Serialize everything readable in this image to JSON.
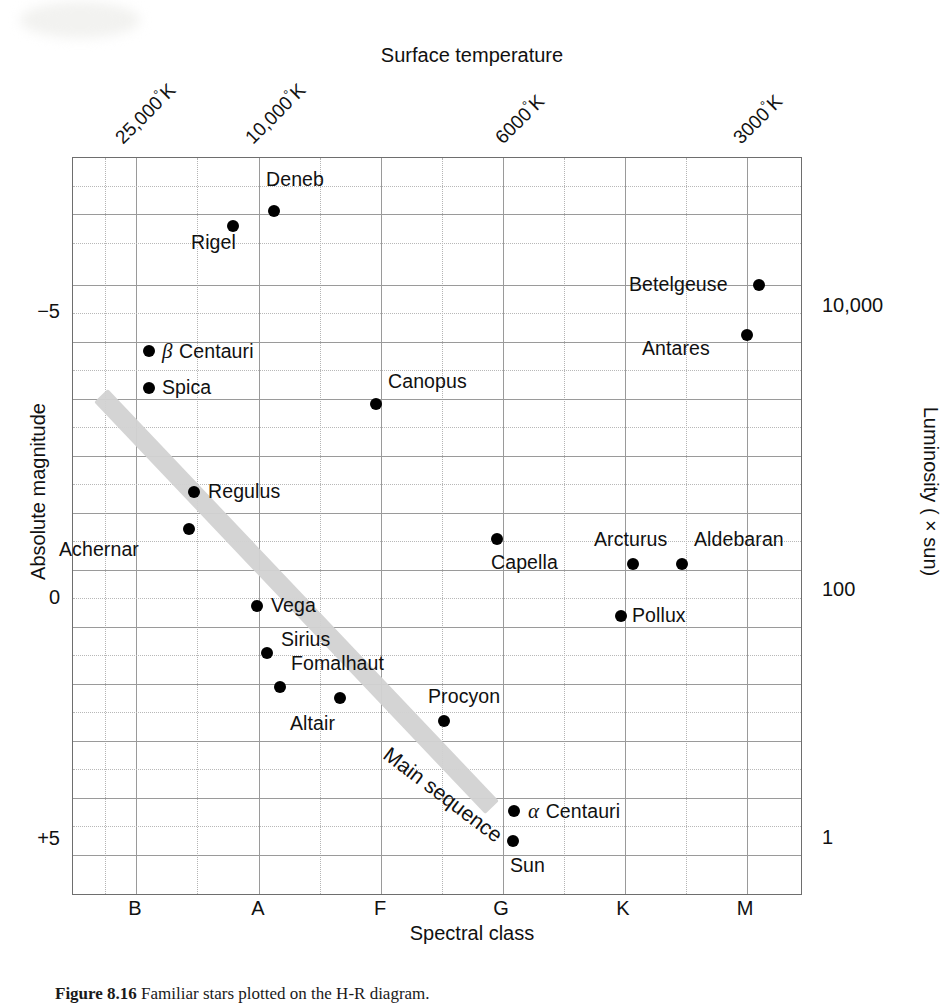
{
  "figure": {
    "caption_label": "Figure 8.16",
    "caption_text": "Familiar stars plotted on the H-R diagram."
  },
  "axes": {
    "top_title": "Surface temperature",
    "bottom_title": "Spectral class",
    "left_title": "Absolute magnitude",
    "right_title": "Luminosity ( × sun)",
    "top_ticks": [
      {
        "label": "25,000°K",
        "x": 25000
      },
      {
        "label": "10,000°K",
        "x": 10000
      },
      {
        "label": "6000°K",
        "x": 6000
      },
      {
        "label": "3000°K",
        "x": 3000
      }
    ],
    "spectral_classes": [
      "B",
      "A",
      "F",
      "G",
      "K",
      "M"
    ],
    "magnitude_ticks": [
      "−5",
      "0",
      "+5"
    ],
    "luminosity_ticks": [
      "10,000",
      "100",
      "1"
    ]
  },
  "annotations": {
    "main_sequence": "Main sequence"
  },
  "chart_data": {
    "type": "scatter",
    "title": "Familiar stars plotted on the H-R diagram",
    "xlabel": "Spectral class",
    "ylabel": "Absolute magnitude",
    "x2label": "Surface temperature",
    "y2label": "Luminosity ( × sun)",
    "grid": true,
    "legend": "none",
    "xticklabels": [
      "B",
      "A",
      "F",
      "G",
      "K",
      "M"
    ],
    "yticklabels": [
      "−5",
      "0",
      "+5"
    ],
    "ylim": [
      6.2,
      -8.2
    ],
    "y2ticklabels": [
      "10,000",
      "100",
      "1"
    ],
    "x2ticklabels": [
      "25,000°K",
      "10,000°K",
      "6000°K",
      "3000°K"
    ],
    "points": [
      {
        "name": "Deneb",
        "spectral": "A",
        "abs_mag": -7.2,
        "px": 273,
        "py": 210,
        "label_dx": -8,
        "label_dy": -31,
        "align": "left"
      },
      {
        "name": "Rigel",
        "spectral": "B",
        "abs_mag": -6.9,
        "px": 232,
        "py": 225,
        "label_dx": -42,
        "label_dy": 17,
        "align": "left"
      },
      {
        "name": "Betelgeuse",
        "spectral": "M",
        "abs_mag": -5.6,
        "px": 758,
        "py": 284,
        "label_dx": -130,
        "label_dy": 0,
        "align": "left"
      },
      {
        "name": "Antares",
        "spectral": "M",
        "abs_mag": -4.7,
        "px": 746,
        "py": 334,
        "label_dx": -105,
        "label_dy": 14,
        "align": "left"
      },
      {
        "name": "β Centauri",
        "spectral": "B",
        "abs_mag": -4.1,
        "px": 148,
        "py": 350,
        "label_dx": 13,
        "label_dy": 0,
        "align": "left",
        "greek": "β",
        "rest": "Centauri"
      },
      {
        "name": "Spica",
        "spectral": "B",
        "abs_mag": -3.5,
        "px": 148,
        "py": 387,
        "label_dx": 13,
        "label_dy": 0,
        "align": "left"
      },
      {
        "name": "Canopus",
        "spectral": "F",
        "abs_mag": -3.1,
        "px": 375,
        "py": 403,
        "label_dx": 12,
        "label_dy": -22,
        "align": "left"
      },
      {
        "name": "Regulus",
        "spectral": "B",
        "abs_mag": -0.6,
        "px": 193,
        "py": 491,
        "label_dx": 14,
        "label_dy": 0,
        "align": "left"
      },
      {
        "name": "Achernar",
        "spectral": "B",
        "abs_mag": -0.1,
        "px": 188,
        "py": 528,
        "label_dx": -130,
        "label_dy": 21,
        "align": "left"
      },
      {
        "name": "Capella",
        "spectral": "G",
        "abs_mag": 0.4,
        "px": 496,
        "py": 538,
        "label_dx": -6,
        "label_dy": 24,
        "align": "left"
      },
      {
        "name": "Arcturus",
        "spectral": "K",
        "abs_mag": 0.8,
        "px": 632,
        "py": 563,
        "label_dx": -39,
        "label_dy": -24,
        "align": "left"
      },
      {
        "name": "Aldebaran",
        "spectral": "K",
        "abs_mag": 0.8,
        "px": 681,
        "py": 563,
        "label_dx": 12,
        "label_dy": -24,
        "align": "left"
      },
      {
        "name": "Vega",
        "spectral": "A",
        "abs_mag": 1.3,
        "px": 256,
        "py": 605,
        "label_dx": 14,
        "label_dy": 0,
        "align": "left"
      },
      {
        "name": "Pollux",
        "spectral": "K",
        "abs_mag": 1.7,
        "px": 620,
        "py": 615,
        "label_dx": 11,
        "label_dy": 0,
        "align": "left"
      },
      {
        "name": "Sirius",
        "spectral": "A",
        "abs_mag": 2.1,
        "px": 266,
        "py": 652,
        "label_dx": 14,
        "label_dy": -13,
        "align": "left"
      },
      {
        "name": "Fomalhaut",
        "spectral": "A",
        "abs_mag": 2.6,
        "px": 279,
        "py": 686,
        "label_dx": 11,
        "label_dy": -23,
        "align": "left"
      },
      {
        "name": "Altair",
        "spectral": "A",
        "abs_mag": 2.8,
        "px": 339,
        "py": 697,
        "label_dx": -50,
        "label_dy": 26,
        "align": "left"
      },
      {
        "name": "Procyon",
        "spectral": "F",
        "abs_mag": 3.2,
        "px": 443,
        "py": 720,
        "label_dx": -16,
        "label_dy": -24,
        "align": "left"
      },
      {
        "name": "α Centauri",
        "spectral": "G",
        "abs_mag": 4.4,
        "px": 513,
        "py": 810,
        "label_dx": 14,
        "label_dy": 0,
        "align": "left",
        "greek": "α",
        "rest": "Centauri"
      },
      {
        "name": "Sun",
        "spectral": "G",
        "abs_mag": 4.9,
        "px": 512,
        "py": 840,
        "label_dx": -3,
        "label_dy": 25,
        "align": "left"
      }
    ]
  }
}
